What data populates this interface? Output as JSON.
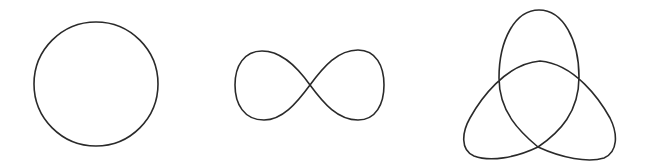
{
  "diagram": {
    "stroke_color": "#2a2a2a",
    "background": "#ffffff",
    "shapes": [
      {
        "id": "circle",
        "name": "circle",
        "center": [
          96,
          84
        ],
        "radius": 62
      },
      {
        "id": "infinity",
        "name": "lemniscate",
        "center": [
          310,
          85
        ],
        "width": 150,
        "height": 70
      },
      {
        "id": "trefoil",
        "name": "trefoil",
        "bounds": [
          462,
          10,
          618,
          160
        ]
      }
    ]
  }
}
